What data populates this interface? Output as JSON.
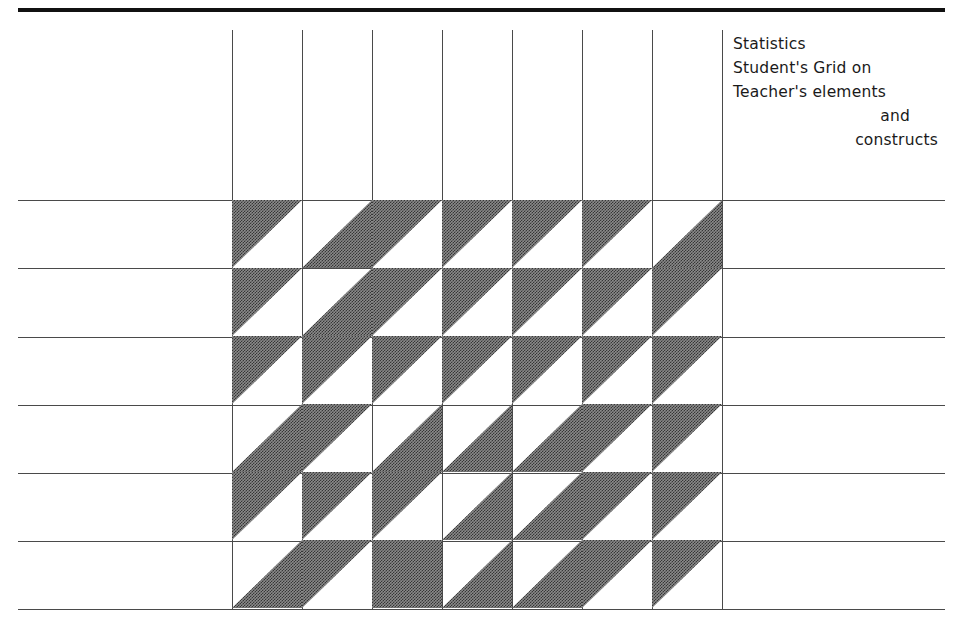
{
  "caption": {
    "lines": [
      "Statistics",
      "Student's Grid on",
      "Teacher's elements",
      "and",
      "constructs"
    ]
  },
  "rules": {
    "top_rule_label": "top-border-rule",
    "horizontal_y": [
      200,
      268,
      337,
      405,
      473,
      541,
      609
    ],
    "vertical_x": [
      232,
      302,
      372,
      442,
      512,
      582,
      652,
      722
    ],
    "horizontal_left": 18,
    "horizontal_width": 927,
    "vertical_top": 30,
    "vertical_bottom": 609
  },
  "colors": {
    "ink": "#1a1a1a",
    "rule": "#4a4a4a",
    "fill_gray": "#8a8a8a",
    "paper": "#ffffff"
  },
  "grid": {
    "rows": 6,
    "cols": 7,
    "cell_width": 70,
    "cell_height": 68,
    "origin_x": 232,
    "origin_y": 200,
    "fill_legend": {
      "upper-left": "shaded triangle occupying the upper-left half of the cell",
      "lower-right": "shaded triangle occupying the lower-right half of the cell",
      "full": "entire cell shaded",
      "none": "cell left blank"
    },
    "cells": [
      [
        "upper-left",
        "lower-right",
        "upper-left",
        "upper-left",
        "upper-left",
        "upper-left",
        "lower-right"
      ],
      [
        "upper-left",
        "lower-right",
        "upper-left",
        "upper-left",
        "upper-left",
        "upper-left",
        "upper-left"
      ],
      [
        "upper-left",
        "upper-left",
        "upper-left",
        "upper-left",
        "upper-left",
        "upper-left",
        "upper-left"
      ],
      [
        "lower-right",
        "upper-left",
        "lower-right",
        "lower-right",
        "lower-right",
        "upper-left",
        "upper-left"
      ],
      [
        "upper-left",
        "upper-left",
        "upper-left",
        "lower-right",
        "lower-right",
        "upper-left",
        "upper-left"
      ],
      [
        "lower-right",
        "upper-left",
        "full",
        "lower-right",
        "lower-right",
        "upper-left",
        "upper-left"
      ]
    ]
  }
}
